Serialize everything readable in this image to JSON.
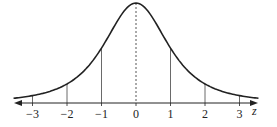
{
  "chart_data": {
    "type": "line",
    "title": "",
    "xlabel": "z",
    "ylabel": "",
    "xlim": [
      -3.5,
      3.5
    ],
    "x_ticks": [
      -3,
      -2,
      -1,
      0,
      1,
      2,
      3
    ],
    "x_tick_labels": [
      "−3",
      "−2",
      "−1",
      "0",
      "1",
      "2",
      "3"
    ],
    "grid": false,
    "legend": null,
    "annotations": [
      "vertical lines at z = -3, -2, -1, 1, 2, 3",
      "dashed vertical line at z = 0"
    ],
    "series": [
      {
        "name": "density",
        "description": "bell-shaped symmetric curve (heavy-tailed), peak at z = 0",
        "x": [
          -3.5,
          -3,
          -2,
          -1,
          0,
          1,
          2,
          3,
          3.5
        ],
        "relative_height": [
          0.03,
          0.06,
          0.17,
          0.5,
          1.0,
          0.5,
          0.17,
          0.06,
          0.03
        ]
      }
    ]
  },
  "axis": {
    "variable_label": "z"
  },
  "colors": {
    "line": "#222222",
    "background": "#ffffff"
  }
}
